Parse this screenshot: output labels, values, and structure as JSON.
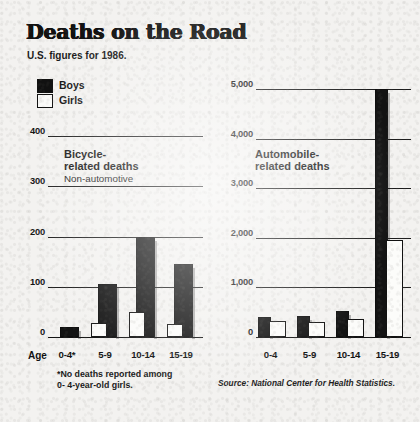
{
  "header": {
    "title": "Deaths on the Road",
    "subtitle": "U.S. figures for 1986."
  },
  "legend": {
    "items": [
      {
        "label": "Boys",
        "color": "#131313",
        "swatch": "filled"
      },
      {
        "label": "Girls",
        "color": "#fcfcfa",
        "swatch": "outline"
      }
    ]
  },
  "footnote": "*No deaths reported among\n 0- 4-year-old girls.",
  "source": "Source: National Center for Health Statistics.",
  "age_caption": "Age",
  "chart_data": [
    {
      "type": "bar",
      "id": "bicycle",
      "title": "Bicycle-\nrelated deaths",
      "title_line1": "Bicycle-",
      "title_line2": "related deaths",
      "subtitle": "Non-automotive",
      "categories": [
        "0-4*",
        "5-9",
        "10-14",
        "15-19"
      ],
      "series": [
        {
          "name": "Boys",
          "values": [
            20,
            105,
            200,
            145
          ]
        },
        {
          "name": "Girls",
          "values": [
            0,
            28,
            50,
            25
          ]
        }
      ],
      "ylim": [
        0,
        400
      ],
      "yticks": [
        0,
        100,
        200,
        300,
        400
      ],
      "ytick_labels": [
        "0",
        "100",
        "200",
        "300",
        "400"
      ],
      "xlabel": "Age",
      "ylabel": "",
      "grid": true,
      "legend_position": "top-left"
    },
    {
      "type": "bar",
      "id": "automobile",
      "title": "Automobile-\nrelated deaths",
      "title_line1": "Automobile-",
      "title_line2": "related deaths",
      "subtitle": "",
      "categories": [
        "0-4",
        "5-9",
        "10-14",
        "15-19"
      ],
      "series": [
        {
          "name": "Boys",
          "values": [
            400,
            420,
            530,
            5000
          ]
        },
        {
          "name": "Girls",
          "values": [
            330,
            310,
            370,
            1950
          ]
        }
      ],
      "ylim": [
        0,
        5000
      ],
      "yticks": [
        0,
        1000,
        2000,
        3000,
        4000,
        5000
      ],
      "ytick_labels": [
        "0",
        "1,000",
        "2,000",
        "3,000",
        "4,000",
        "5,000"
      ],
      "xlabel": "",
      "ylabel": "",
      "grid": true,
      "legend_position": "none"
    }
  ]
}
